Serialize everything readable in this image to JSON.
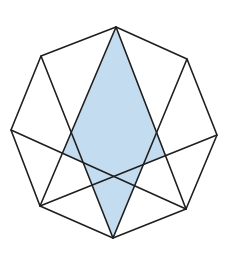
{
  "figure": {
    "colors": {
      "background": "#ffffff",
      "line": "#1f1f1f",
      "fill": "#c3dcef"
    },
    "vertices": {
      "top": [
        116,
        27
      ],
      "upper_right": [
        187,
        59
      ],
      "right": [
        217,
        135
      ],
      "lower_right": [
        186,
        209
      ],
      "bottom": [
        113,
        238
      ],
      "lower_left": [
        40,
        206
      ],
      "left": [
        11,
        130
      ],
      "upper_left": [
        41,
        56
      ]
    },
    "chords": [
      {
        "from": "top",
        "to": "lower_left"
      },
      {
        "from": "top",
        "to": "lower_right"
      },
      {
        "from": "upper_left",
        "to": "bottom"
      },
      {
        "from": "upper_right",
        "to": "bottom"
      },
      {
        "from": "left",
        "to": "lower_right"
      },
      {
        "from": "right",
        "to": "lower_left"
      }
    ],
    "shaded_region": [
      [
        116,
        27
      ],
      [
        165.5,
        155.7
      ],
      [
        143.4,
        164.5
      ],
      [
        113,
        238
      ],
      [
        83.2,
        162.6
      ],
      [
        62.4,
        153.2
      ]
    ]
  }
}
